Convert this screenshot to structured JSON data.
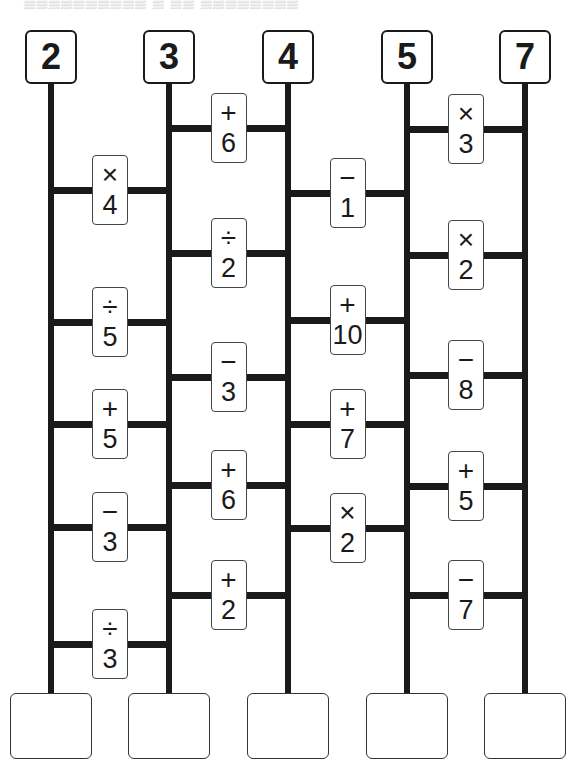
{
  "header": {
    "clipped_text": "▒▒▒▒▒▒▒▒▒▒ ▒ ▒▒ ▒▒▒▒▒▒▒▒"
  },
  "columns": [
    {
      "start": "2",
      "x": 51
    },
    {
      "start": "3",
      "x": 169
    },
    {
      "start": "4",
      "x": 288
    },
    {
      "start": "5",
      "x": 407
    },
    {
      "start": "7",
      "x": 525
    }
  ],
  "rungs": [
    {
      "between": [
        0,
        1
      ],
      "y": 190,
      "op": "×",
      "num": "4"
    },
    {
      "between": [
        0,
        1
      ],
      "y": 322,
      "op": "÷",
      "num": "5"
    },
    {
      "between": [
        0,
        1
      ],
      "y": 424,
      "op": "+",
      "num": "5"
    },
    {
      "between": [
        0,
        1
      ],
      "y": 527,
      "op": "−",
      "num": "3"
    },
    {
      "between": [
        0,
        1
      ],
      "y": 644,
      "op": "÷",
      "num": "3"
    },
    {
      "between": [
        1,
        2
      ],
      "y": 128,
      "op": "+",
      "num": "6"
    },
    {
      "between": [
        1,
        2
      ],
      "y": 253,
      "op": "÷",
      "num": "2"
    },
    {
      "between": [
        1,
        2
      ],
      "y": 377,
      "op": "−",
      "num": "3"
    },
    {
      "between": [
        1,
        2
      ],
      "y": 485,
      "op": "+",
      "num": "6"
    },
    {
      "between": [
        1,
        2
      ],
      "y": 595,
      "op": "+",
      "num": "2"
    },
    {
      "between": [
        2,
        3
      ],
      "y": 193,
      "op": "−",
      "num": "1"
    },
    {
      "between": [
        2,
        3
      ],
      "y": 320,
      "op": "+",
      "num": "10"
    },
    {
      "between": [
        2,
        3
      ],
      "y": 424,
      "op": "+",
      "num": "7"
    },
    {
      "between": [
        2,
        3
      ],
      "y": 528,
      "op": "×",
      "num": "2"
    },
    {
      "between": [
        3,
        4
      ],
      "y": 129,
      "op": "×",
      "num": "3"
    },
    {
      "between": [
        3,
        4
      ],
      "y": 255,
      "op": "×",
      "num": "2"
    },
    {
      "between": [
        3,
        4
      ],
      "y": 375,
      "op": "−",
      "num": "8"
    },
    {
      "between": [
        3,
        4
      ],
      "y": 486,
      "op": "+",
      "num": "5"
    },
    {
      "between": [
        3,
        4
      ],
      "y": 595,
      "op": "−",
      "num": "7"
    }
  ],
  "answers": [
    "",
    "",
    "",
    "",
    ""
  ]
}
